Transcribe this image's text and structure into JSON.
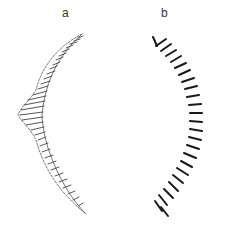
{
  "figure": {
    "panels": [
      {
        "id": "a",
        "label": "a",
        "description": "hatched crescent band with left bulge"
      },
      {
        "id": "b",
        "label": "b",
        "description": "arc of short radial tick strokes"
      }
    ],
    "colors": {
      "ink_light": "#555555",
      "ink_dark": "#1a1a1a",
      "background": "#ffffff"
    }
  }
}
